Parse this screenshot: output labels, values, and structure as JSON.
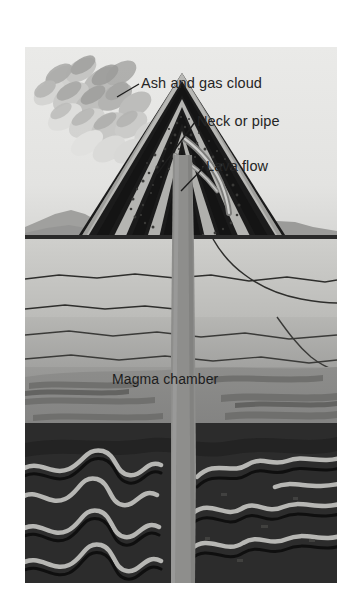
{
  "figure": {
    "type": "diagram",
    "title_text": "",
    "background_color": "#e8e8e6",
    "frame": {
      "left": 25,
      "top": 47,
      "width": 312,
      "height": 536
    }
  },
  "labels": {
    "ash_cloud": "Ash and gas cloud",
    "neck_or_pipe": "Neck or pipe",
    "lava_flow": "Lava flow",
    "magma_chamber": "Magma chamber"
  },
  "colors": {
    "sky": "#e6e6e4",
    "sky_low": "#dcdcda",
    "distant_hills": "#9d9d9b",
    "ground_line": "#2a2a2a",
    "upper_rock": "#c8c8c5",
    "mid_rock": "#b0b0ad",
    "lower_rock": "#8f8f8d",
    "magma": "#8a8a88",
    "magma_streak": "#6d6d6b",
    "deep_rock": "#2e2e2e",
    "deep_rock_dark": "#232323",
    "fold_band_light": "#b9b9b6",
    "fold_band_dark": "#141414",
    "cone_dark_strata": "#151515",
    "cone_light_strata": "#b5b5b2",
    "pipe": "#8e8e8c",
    "ash_light": "#dcdcda",
    "ash_mid": "#bfbfbd",
    "ash_dark": "#a3a3a1",
    "leader_line": "#1c1c1c",
    "label_text": "#252525"
  },
  "elements": {
    "ash_cloud_lobes": 22,
    "cone_strata_bands": 9,
    "fold_bands": 7,
    "rock_cracks": 6,
    "ash_particles": 90
  },
  "leader_lines": [
    {
      "name": "ash-cloud-leader",
      "x1": 138,
      "y1": 84,
      "x2": 118,
      "y2": 96
    },
    {
      "name": "neck-or-pipe-leader",
      "x1": 194,
      "y1": 122,
      "x2": 156,
      "y2": 172
    },
    {
      "name": "lava-flow-leader",
      "x1": 203,
      "y1": 167,
      "x2": 180,
      "y2": 190
    }
  ]
}
